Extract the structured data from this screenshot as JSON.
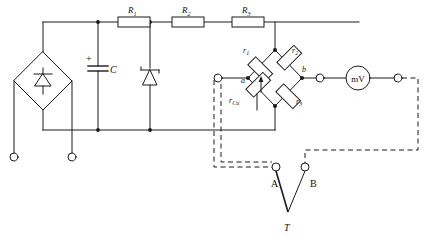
{
  "diagram": {
    "stroke_color": "#1a1a1a",
    "background": "#ffffff"
  },
  "power_supply": {
    "rectifier_name": "bridge-rectifier",
    "diode_symbol": "zener-diode",
    "input_terminal_1": "",
    "input_terminal_2": ""
  },
  "components": {
    "capacitor": {
      "label": "C",
      "polarity": "+"
    },
    "zener": {
      "label": ""
    },
    "series_resistors": [
      {
        "label": "R",
        "sub": "1"
      },
      {
        "label": "R",
        "sub": "2"
      },
      {
        "label": "R",
        "sub": "3"
      }
    ]
  },
  "bridge": {
    "arms": [
      {
        "label": "r",
        "sub": "1",
        "position": "top-left"
      },
      {
        "label": "r",
        "sub": "2",
        "position": "top-right"
      },
      {
        "label": "r",
        "sub": "Cu",
        "position": "bottom-left"
      },
      {
        "label": "r",
        "sub": "3",
        "position": "bottom-right"
      }
    ],
    "node_left": "a",
    "node_right": "b"
  },
  "meter": {
    "label": "mV"
  },
  "switch": {
    "terminal_a": "A",
    "terminal_b": "B",
    "common": "T"
  }
}
